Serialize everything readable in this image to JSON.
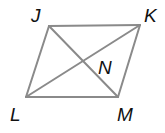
{
  "diagram": {
    "type": "parallelogram-with-diagonals",
    "line_color": "#8a8a8a",
    "label_color": "#111111",
    "vertices": {
      "J": {
        "x": 49,
        "y": 26
      },
      "K": {
        "x": 140,
        "y": 25
      },
      "M": {
        "x": 118,
        "y": 97
      },
      "L": {
        "x": 26,
        "y": 97
      }
    },
    "intersection": "N",
    "labels": [
      {
        "text": "J",
        "x": 31,
        "y": 22
      },
      {
        "text": "K",
        "x": 144,
        "y": 22
      },
      {
        "text": "L",
        "x": 10,
        "y": 121
      },
      {
        "text": "M",
        "x": 117,
        "y": 121
      },
      {
        "text": "N",
        "x": 98,
        "y": 74
      }
    ],
    "edges": [
      [
        "J",
        "K"
      ],
      [
        "K",
        "M"
      ],
      [
        "M",
        "L"
      ],
      [
        "L",
        "J"
      ]
    ],
    "diagonals": [
      [
        "J",
        "M"
      ],
      [
        "L",
        "K"
      ]
    ]
  }
}
